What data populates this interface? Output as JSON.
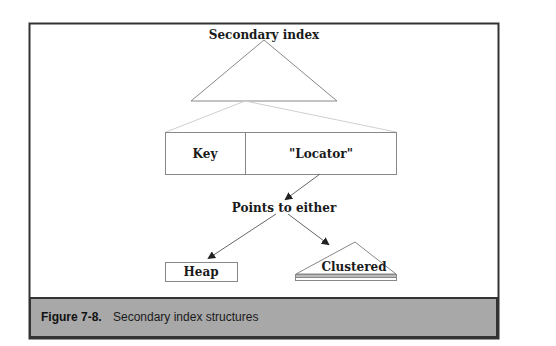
{
  "diagram": {
    "title_node": "Secondary index",
    "entry": {
      "key_label": "Key",
      "locator_label": "\"Locator\""
    },
    "pointer_label": "Points to either",
    "targets": [
      {
        "label": "Heap",
        "shape": "rectangle"
      },
      {
        "label": "Clustered",
        "shape": "triangle"
      }
    ],
    "colors": {
      "frame": "#333333",
      "lines": "#777777",
      "light_lines": "#cccccc",
      "caption_bg": "#a8a8a8",
      "text": "#1a1a1a"
    }
  },
  "caption": {
    "number": "Figure 7-8.",
    "text": "Secondary index structures"
  }
}
